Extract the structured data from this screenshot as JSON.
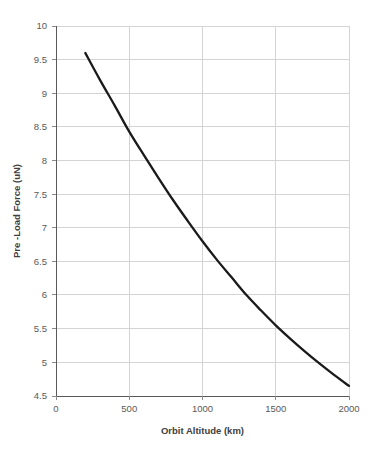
{
  "chart_data": {
    "type": "line",
    "title": "",
    "subtitle": "",
    "xlabel": "Orbit Altitude (km)",
    "ylabel": "Pre -Load Force (uN)",
    "xlim": [
      0,
      2000
    ],
    "ylim": [
      4.5,
      10
    ],
    "xticks": [
      0,
      500,
      1000,
      1500,
      2000
    ],
    "yticks": [
      4.5,
      5,
      5.5,
      6,
      6.5,
      7,
      7.5,
      8,
      8.5,
      9,
      9.5,
      10
    ],
    "xtick_labels": [
      "0",
      "500",
      "1000",
      "1500",
      "2000"
    ],
    "ytick_labels": [
      "4.5",
      "5",
      "5.5",
      "6",
      "6.5",
      "7",
      "7.5",
      "8",
      "8.5",
      "9",
      "9.5",
      "10"
    ],
    "grid": {
      "horizontal": true,
      "vertical": true,
      "color": "#d4d4d4"
    },
    "legend": {
      "visible": false,
      "position": "none"
    },
    "annotations": [],
    "series": [
      {
        "name": "Pre-Load Force",
        "color": "#1a1a1a",
        "line_width": 2.3,
        "markers": false,
        "x": [
          200,
          300,
          400,
          500,
          600,
          700,
          800,
          900,
          1000,
          1100,
          1200,
          1300,
          1400,
          1500,
          1600,
          1700,
          1800,
          1900,
          2000
        ],
        "y": [
          9.6,
          9.2,
          8.82,
          8.43,
          8.08,
          7.74,
          7.41,
          7.1,
          6.8,
          6.52,
          6.26,
          6.0,
          5.77,
          5.55,
          5.35,
          5.16,
          4.98,
          4.81,
          4.65
        ]
      }
    ]
  },
  "axes": {
    "x_axis_name": "Orbit Altitude (km)",
    "y_axis_name": "Pre -Load Force (uN)"
  }
}
